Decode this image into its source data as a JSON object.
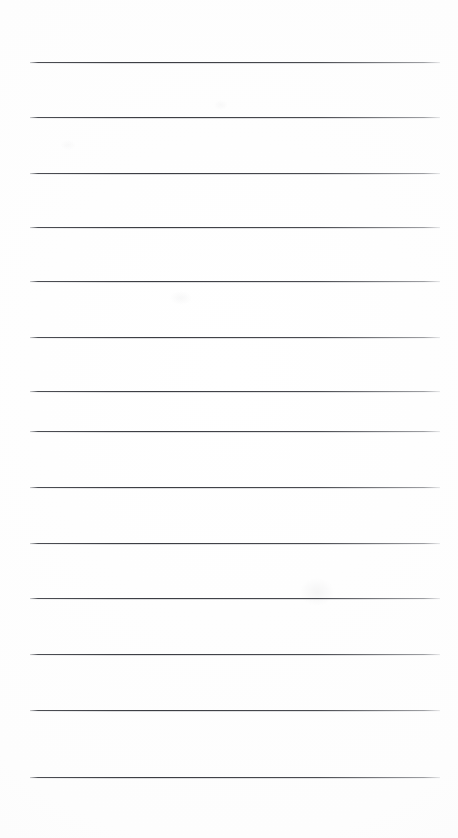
{
  "document": {
    "type": "scanned-lined-paper",
    "title": "",
    "background_color": "#ffffff",
    "line_color": "#3a3c42",
    "page_width": 458,
    "page_height": 838,
    "text_content": "",
    "lines": [
      {
        "index": 1,
        "y": 62,
        "x_start": 30,
        "x_end": 440,
        "content": ""
      },
      {
        "index": 2,
        "y": 117,
        "x_start": 30,
        "x_end": 440,
        "content": ""
      },
      {
        "index": 3,
        "y": 173,
        "x_start": 30,
        "x_end": 440,
        "content": ""
      },
      {
        "index": 4,
        "y": 227,
        "x_start": 30,
        "x_end": 440,
        "content": ""
      },
      {
        "index": 5,
        "y": 281,
        "x_start": 30,
        "x_end": 440,
        "content": ""
      },
      {
        "index": 6,
        "y": 337,
        "x_start": 30,
        "x_end": 440,
        "content": ""
      },
      {
        "index": 7,
        "y": 391,
        "x_start": 30,
        "x_end": 440,
        "content": ""
      },
      {
        "index": 8,
        "y": 431,
        "x_start": 30,
        "x_end": 440,
        "content": ""
      },
      {
        "index": 9,
        "y": 487,
        "x_start": 30,
        "x_end": 440,
        "content": ""
      },
      {
        "index": 10,
        "y": 543,
        "x_start": 30,
        "x_end": 440,
        "content": ""
      },
      {
        "index": 11,
        "y": 598,
        "x_start": 30,
        "x_end": 440,
        "content": ""
      },
      {
        "index": 12,
        "y": 654,
        "x_start": 30,
        "x_end": 440,
        "content": ""
      },
      {
        "index": 13,
        "y": 710,
        "x_start": 30,
        "x_end": 440,
        "content": ""
      },
      {
        "index": 14,
        "y": 777,
        "x_start": 30,
        "x_end": 440,
        "content": ""
      }
    ],
    "artifacts": [
      {
        "name": "faint-smudge-upper",
        "x": 170,
        "y": 291,
        "w": 22,
        "h": 14,
        "opacity": 0.045
      },
      {
        "name": "faint-smudge-mid",
        "x": 214,
        "y": 100,
        "w": 14,
        "h": 10,
        "opacity": 0.035
      },
      {
        "name": "faint-smudge-lower",
        "x": 300,
        "y": 578,
        "w": 34,
        "h": 28,
        "opacity": 0.055
      },
      {
        "name": "faint-smudge-edge",
        "x": 60,
        "y": 140,
        "w": 16,
        "h": 10,
        "opacity": 0.03
      }
    ]
  }
}
